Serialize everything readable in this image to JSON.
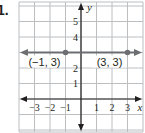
{
  "problem": {
    "number": "1."
  },
  "chart_data": {
    "type": "line",
    "title": "",
    "xlabel": "x",
    "ylabel": "y",
    "xlim": [
      -4,
      4
    ],
    "ylim": [
      -2,
      6
    ],
    "grid": true,
    "x_ticks": [
      {
        "value": -3,
        "label": "−3"
      },
      {
        "value": -2,
        "label": "−2"
      },
      {
        "value": -1,
        "label": "−1"
      },
      {
        "value": 1,
        "label": "1"
      },
      {
        "value": 2,
        "label": "2"
      },
      {
        "value": 3,
        "label": "3"
      }
    ],
    "y_ticks": [
      {
        "value": 1,
        "label": "1"
      },
      {
        "value": 2,
        "label": "2"
      },
      {
        "value": 4,
        "label": "4"
      },
      {
        "value": 5,
        "label": "5"
      }
    ],
    "series": [
      {
        "name": "horizontal line y = 3",
        "equation": "y = 3",
        "points": [
          {
            "x": -1,
            "y": 3,
            "label": "(−1, 3)"
          },
          {
            "x": 3,
            "y": 3,
            "label": "(3, 3)"
          }
        ],
        "color": "#6d6e71"
      }
    ],
    "colors": {
      "grid": "#bcbec0",
      "axis": "#231f20",
      "line": "#6d6e71"
    }
  }
}
